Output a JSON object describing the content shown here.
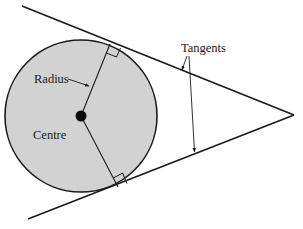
{
  "diagram": {
    "labels": {
      "radius": "Radius",
      "centre": "Centre",
      "tangents": "Tangents"
    },
    "colors": {
      "circle_fill": "#d2d2d2",
      "stroke": "#1a1a1a",
      "background": "#ffffff"
    },
    "elements": [
      "circle",
      "centre-point",
      "radius-to-upper-tangent",
      "radius-to-lower-tangent",
      "upper-tangent-line",
      "lower-tangent-line",
      "right-angle-marks"
    ]
  }
}
